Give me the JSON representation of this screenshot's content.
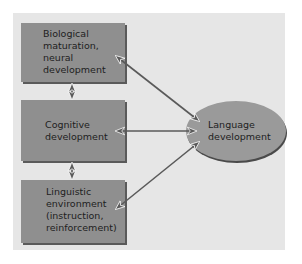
{
  "diagram": {
    "nodes": [
      {
        "id": "biological",
        "label": "Biological\nmaturation,\nneural\ndevelopment",
        "shape": "rectangle"
      },
      {
        "id": "cognitive",
        "label": "Cognitive\ndevelopment",
        "shape": "rectangle"
      },
      {
        "id": "linguistic",
        "label": "Linguistic\nenvironment\n(instruction,\nreinforcement)",
        "shape": "rectangle"
      },
      {
        "id": "language",
        "label": "Language\ndevelopment",
        "shape": "ellipse"
      }
    ],
    "edges": [
      {
        "from": "biological",
        "to": "cognitive",
        "direction": "bidirectional"
      },
      {
        "from": "cognitive",
        "to": "linguistic",
        "direction": "bidirectional"
      },
      {
        "from": "biological",
        "to": "language",
        "direction": "bidirectional"
      },
      {
        "from": "cognitive",
        "to": "language",
        "direction": "bidirectional"
      },
      {
        "from": "linguistic",
        "to": "language",
        "direction": "bidirectional"
      }
    ],
    "colors": {
      "panel": "#e6e6e6",
      "node_fill": "#8f8f8f",
      "ellipse_fill": "#9a9a9a",
      "arrow": "#555555"
    }
  }
}
